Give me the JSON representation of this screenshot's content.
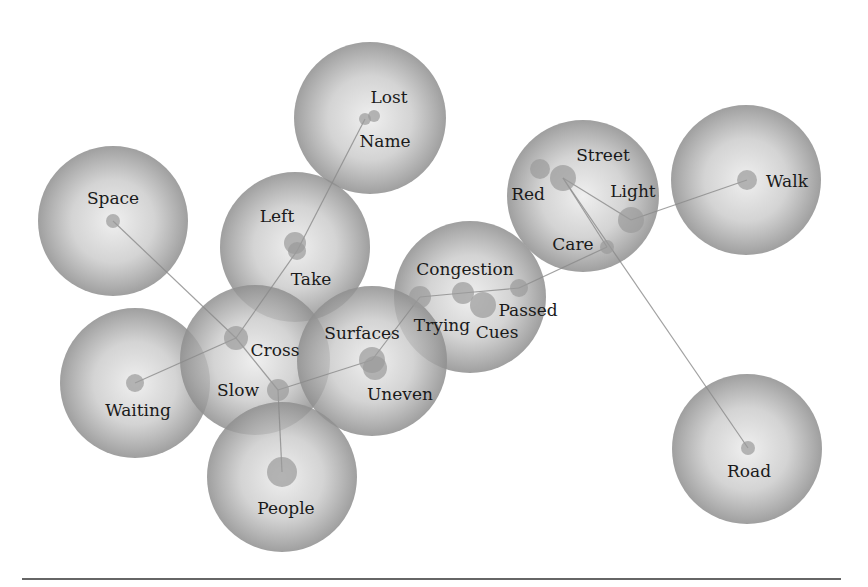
{
  "diagram": {
    "type": "concept-cluster-network",
    "colors": {
      "bubble_edge": "#8f8f8f",
      "bubble_center": "#efefef",
      "node_fill": "#9a9a9a",
      "edge_line": "#8a8a8a",
      "label": "#1a1a1a",
      "divider": "#666666"
    },
    "clusters": [
      {
        "id": "lost",
        "cx": 370,
        "cy": 118,
        "r": 76
      },
      {
        "id": "space",
        "cx": 113,
        "cy": 221,
        "r": 75
      },
      {
        "id": "left",
        "cx": 295,
        "cy": 247,
        "r": 75
      },
      {
        "id": "street",
        "cx": 583,
        "cy": 196,
        "r": 76
      },
      {
        "id": "walk",
        "cx": 746,
        "cy": 180,
        "r": 75
      },
      {
        "id": "congestion",
        "cx": 470,
        "cy": 297,
        "r": 76
      },
      {
        "id": "waiting",
        "cx": 135,
        "cy": 383,
        "r": 75
      },
      {
        "id": "cross",
        "cx": 255,
        "cy": 360,
        "r": 75
      },
      {
        "id": "surfaces",
        "cx": 372,
        "cy": 361,
        "r": 75
      },
      {
        "id": "people",
        "cx": 282,
        "cy": 477,
        "r": 75
      },
      {
        "id": "road",
        "cx": 747,
        "cy": 449,
        "r": 75
      }
    ],
    "nodes": [
      {
        "id": "lost",
        "label": "Lost",
        "x": 374,
        "y": 116,
        "r": 6,
        "lx": 389,
        "ly": 103
      },
      {
        "id": "name",
        "label": "Name",
        "x": 365,
        "y": 119,
        "r": 6,
        "lx": 385,
        "ly": 147
      },
      {
        "id": "space",
        "label": "Space",
        "x": 113,
        "y": 221,
        "r": 7,
        "lx": 113,
        "ly": 204
      },
      {
        "id": "left",
        "label": "Left",
        "x": 295,
        "y": 243,
        "r": 11,
        "lx": 277,
        "ly": 222
      },
      {
        "id": "take",
        "label": "Take",
        "x": 297,
        "y": 251,
        "r": 9,
        "lx": 311,
        "ly": 285
      },
      {
        "id": "red",
        "label": "Red",
        "x": 540,
        "y": 169,
        "r": 10,
        "lx": 528,
        "ly": 200
      },
      {
        "id": "street",
        "label": "Street",
        "x": 563,
        "y": 178,
        "r": 13,
        "lx": 603,
        "ly": 161
      },
      {
        "id": "light",
        "label": "Light",
        "x": 631,
        "y": 220,
        "r": 13,
        "lx": 633,
        "ly": 197
      },
      {
        "id": "care",
        "label": "Care",
        "x": 607,
        "y": 247,
        "r": 7,
        "lx": 573,
        "ly": 250
      },
      {
        "id": "walk",
        "label": "Walk",
        "x": 747,
        "y": 180,
        "r": 10,
        "lx": 787,
        "ly": 187
      },
      {
        "id": "congestion",
        "label": "Congestion",
        "x": 463,
        "y": 293,
        "r": 11,
        "lx": 465,
        "ly": 275
      },
      {
        "id": "cues",
        "label": "Cues",
        "x": 483,
        "y": 305,
        "r": 13,
        "lx": 497,
        "ly": 338
      },
      {
        "id": "passed",
        "label": "Passed",
        "x": 519,
        "y": 288,
        "r": 9,
        "lx": 528,
        "ly": 316
      },
      {
        "id": "trying",
        "label": "Trying",
        "x": 420,
        "y": 297,
        "r": 11,
        "lx": 442,
        "ly": 331
      },
      {
        "id": "cross",
        "label": "Cross",
        "x": 236,
        "y": 338,
        "r": 12,
        "lx": 275,
        "ly": 356
      },
      {
        "id": "slow",
        "label": "Slow",
        "x": 278,
        "y": 390,
        "r": 11,
        "lx": 238,
        "ly": 396
      },
      {
        "id": "surfaces",
        "label": "Surfaces",
        "x": 372,
        "y": 360,
        "r": 13,
        "lx": 362,
        "ly": 339
      },
      {
        "id": "uneven",
        "label": "Uneven",
        "x": 375,
        "y": 368,
        "r": 12,
        "lx": 400,
        "ly": 400
      },
      {
        "id": "waiting",
        "label": "Waiting",
        "x": 135,
        "y": 383,
        "r": 9,
        "lx": 138,
        "ly": 416
      },
      {
        "id": "people",
        "label": "People",
        "x": 282,
        "y": 472,
        "r": 15,
        "lx": 286,
        "ly": 514
      },
      {
        "id": "road",
        "label": "Road",
        "x": 748,
        "y": 448,
        "r": 7,
        "lx": 749,
        "ly": 477
      }
    ],
    "edges": [
      [
        "name",
        "take"
      ],
      [
        "take",
        "cross"
      ],
      [
        "space",
        "cross"
      ],
      [
        "waiting",
        "cross"
      ],
      [
        "cross",
        "slow"
      ],
      [
        "slow",
        "people"
      ],
      [
        "slow",
        "surfaces"
      ],
      [
        "surfaces",
        "trying"
      ],
      [
        "trying",
        "congestion"
      ],
      [
        "congestion",
        "passed"
      ],
      [
        "passed",
        "care"
      ],
      [
        "care",
        "street"
      ],
      [
        "street",
        "light"
      ],
      [
        "light",
        "walk"
      ],
      [
        "street",
        "road"
      ]
    ]
  }
}
